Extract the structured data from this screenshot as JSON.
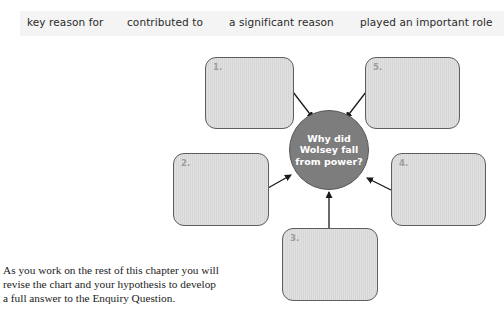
{
  "phrase_bar": {
    "phrases": [
      "key reason for",
      "contributed to",
      "a significant reason",
      "played an important role"
    ]
  },
  "diagram": {
    "center_question": "Why did Wolsey fall from power?",
    "center_lines": [
      "Why did",
      "Wolsey fall",
      "from power?"
    ],
    "boxes": [
      {
        "number": "1."
      },
      {
        "number": "2."
      },
      {
        "number": "3."
      },
      {
        "number": "4."
      },
      {
        "number": "5."
      }
    ],
    "colors": {
      "box_fill": "#dcdcdc",
      "box_border": "#5e5e5e",
      "circle_fill": "#7d7d7d",
      "circle_text": "#ffffff",
      "number_text": "#9c9c9c",
      "arrow": "#1a1a1a"
    }
  },
  "body_text": {
    "paragraph": "As you work on the rest of this chapter you will revise the chart and your hypothesis to develop a full answer to the Enquiry Question.",
    "lines": [
      "As you work on the rest of this chapter you will",
      "revise the chart and your hypothesis to develop",
      "a full answer to the Enquiry Question."
    ]
  }
}
